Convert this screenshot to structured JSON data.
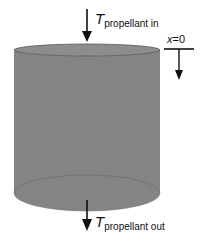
{
  "diagram": {
    "type": "cylinder-flow-schematic",
    "colors": {
      "cylinder_fill": "#8a8a8a",
      "cylinder_edge": "#555555",
      "arrow": "#111111",
      "background": "#ffffff"
    },
    "inlet": {
      "symbol": "T",
      "subscript": "propellant in"
    },
    "outlet": {
      "symbol": "T",
      "subscript": "propellant out"
    },
    "axis_marker": {
      "variable": "x",
      "equals": "=0"
    }
  }
}
